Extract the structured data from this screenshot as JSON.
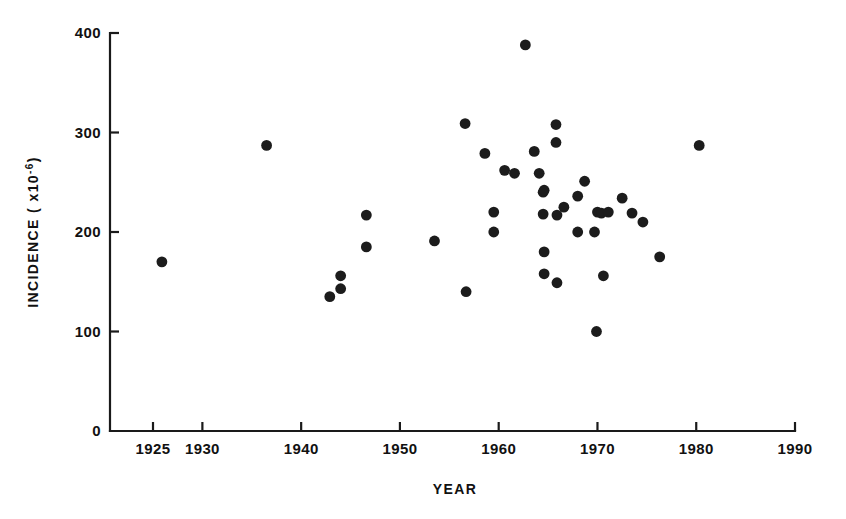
{
  "figure": {
    "background_color": "#ffffff",
    "ink_color": "#1a1a1a",
    "point_color": "#1c1c1c"
  },
  "axes": {
    "x_title": "YEAR",
    "y_title_main": "INCIDENCE ( x10",
    "y_title_exponent": "-6",
    "y_title_close": ")",
    "x_ticks": [
      "1925",
      "1930",
      "1940",
      "1950",
      "1960",
      "1970",
      "1980",
      "1990"
    ],
    "x_tick_values": [
      1925,
      1930,
      1940,
      1950,
      1960,
      1970,
      1980,
      1990
    ],
    "y_ticks": [
      "0",
      "100",
      "200",
      "300",
      "400"
    ],
    "y_tick_values": [
      0,
      100,
      200,
      300,
      400
    ]
  },
  "chart_data": {
    "type": "scatter",
    "title": "",
    "xlabel": "YEAR",
    "ylabel": "INCIDENCE ( x10-6)",
    "xlim": [
      1922,
      1992
    ],
    "ylim": [
      0,
      400
    ],
    "grid": false,
    "legend": "none",
    "marker": "filled-circle",
    "points": [
      {
        "x": 1925.9,
        "y": 170
      },
      {
        "x": 1936.5,
        "y": 287
      },
      {
        "x": 1942.9,
        "y": 135
      },
      {
        "x": 1944.0,
        "y": 143
      },
      {
        "x": 1944.0,
        "y": 156
      },
      {
        "x": 1946.6,
        "y": 185
      },
      {
        "x": 1946.6,
        "y": 217
      },
      {
        "x": 1953.5,
        "y": 191
      },
      {
        "x": 1956.6,
        "y": 309
      },
      {
        "x": 1956.7,
        "y": 140
      },
      {
        "x": 1958.6,
        "y": 279
      },
      {
        "x": 1959.5,
        "y": 220
      },
      {
        "x": 1959.5,
        "y": 200
      },
      {
        "x": 1960.6,
        "y": 262
      },
      {
        "x": 1961.6,
        "y": 259
      },
      {
        "x": 1962.7,
        "y": 388
      },
      {
        "x": 1963.6,
        "y": 281
      },
      {
        "x": 1964.1,
        "y": 259
      },
      {
        "x": 1964.5,
        "y": 240
      },
      {
        "x": 1964.5,
        "y": 218
      },
      {
        "x": 1964.6,
        "y": 242
      },
      {
        "x": 1964.6,
        "y": 180
      },
      {
        "x": 1964.6,
        "y": 158
      },
      {
        "x": 1965.8,
        "y": 308
      },
      {
        "x": 1965.8,
        "y": 290
      },
      {
        "x": 1965.9,
        "y": 217
      },
      {
        "x": 1965.9,
        "y": 149
      },
      {
        "x": 1966.6,
        "y": 225
      },
      {
        "x": 1968.0,
        "y": 236
      },
      {
        "x": 1968.0,
        "y": 200
      },
      {
        "x": 1968.7,
        "y": 251
      },
      {
        "x": 1969.7,
        "y": 200
      },
      {
        "x": 1969.9,
        "y": 100
      },
      {
        "x": 1970.0,
        "y": 220
      },
      {
        "x": 1970.4,
        "y": 219
      },
      {
        "x": 1970.6,
        "y": 156
      },
      {
        "x": 1971.1,
        "y": 220
      },
      {
        "x": 1972.5,
        "y": 234
      },
      {
        "x": 1973.5,
        "y": 219
      },
      {
        "x": 1974.6,
        "y": 210
      },
      {
        "x": 1976.3,
        "y": 175
      },
      {
        "x": 1980.3,
        "y": 287
      }
    ]
  },
  "plot_geometry": {
    "origin_x_px": 110,
    "origin_y_px": 431,
    "x_at_1925_px": 153,
    "px_per_year": 9.877,
    "y_at_0_px": 431,
    "px_per_unit": 0.995,
    "axis_right_px": 795,
    "axis_top_px": 33,
    "tick_len_px": 9,
    "point_radius_px": 5.4
  }
}
